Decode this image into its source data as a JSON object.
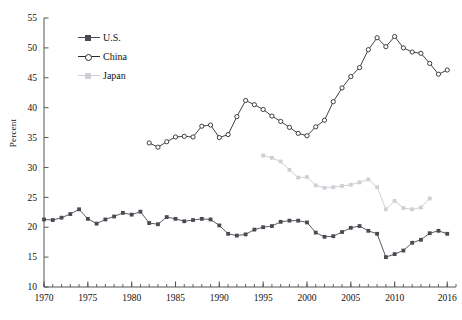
{
  "axes": {
    "ylabel": "Percent",
    "ylim": [
      10,
      55
    ],
    "yticks": [
      10,
      15,
      20,
      25,
      30,
      35,
      40,
      45,
      50,
      55
    ],
    "xlim": [
      1970,
      2017
    ],
    "xticks": [
      1970,
      1975,
      1980,
      1985,
      1990,
      1995,
      2000,
      2005,
      2010,
      2016
    ],
    "xtick_labels": [
      "1970",
      "1975",
      "1980",
      "1985",
      "1990",
      "1995",
      "2000",
      "2005",
      "2010",
      "2016"
    ],
    "minor_tick_step": 1
  },
  "legend": {
    "position": "top-left-inside",
    "entries": [
      {
        "label": "U.S.",
        "marker": "filled-square",
        "color": "#4a4a52"
      },
      {
        "label": "China",
        "marker": "open-circle",
        "color": "#2b2b2b"
      },
      {
        "label": "Japan",
        "marker": "filled-square",
        "color": "#cfcfd6"
      }
    ]
  },
  "caption": "",
  "chart_data": {
    "type": "line",
    "title": "",
    "xlabel": "",
    "ylabel": "Percent",
    "xlim": [
      1970,
      2017
    ],
    "ylim": [
      10,
      55
    ],
    "grid": false,
    "legend_position": "top-left-inside",
    "series": [
      {
        "name": "U.S.",
        "color": "#4a4a52",
        "marker": "filled-square",
        "x": [
          1970,
          1971,
          1972,
          1973,
          1974,
          1975,
          1976,
          1977,
          1978,
          1979,
          1980,
          1981,
          1982,
          1983,
          1984,
          1985,
          1986,
          1987,
          1988,
          1989,
          1990,
          1991,
          1992,
          1993,
          1994,
          1995,
          1996,
          1997,
          1998,
          1999,
          2000,
          2001,
          2002,
          2003,
          2004,
          2005,
          2006,
          2007,
          2008,
          2009,
          2010,
          2011,
          2012,
          2013,
          2014,
          2015,
          2016
        ],
        "y": [
          21.3,
          21.2,
          21.6,
          22.2,
          23.0,
          21.4,
          20.6,
          21.3,
          21.8,
          22.4,
          22.1,
          22.6,
          20.7,
          20.5,
          21.7,
          21.4,
          21.0,
          21.2,
          21.4,
          21.3,
          20.3,
          18.9,
          18.6,
          18.8,
          19.6,
          20.0,
          20.2,
          20.9,
          21.1,
          21.1,
          20.8,
          19.1,
          18.4,
          18.5,
          19.2,
          19.9,
          20.2,
          19.4,
          18.9,
          15.0,
          15.5,
          16.1,
          17.4,
          17.9,
          19.0,
          19.4,
          18.9
        ]
      },
      {
        "name": "China",
        "color": "#2b2b2b",
        "marker": "open-circle",
        "x": [
          1982,
          1983,
          1984,
          1985,
          1986,
          1987,
          1988,
          1989,
          1990,
          1991,
          1992,
          1993,
          1994,
          1995,
          1996,
          1997,
          1998,
          1999,
          2000,
          2001,
          2002,
          2003,
          2004,
          2005,
          2006,
          2007,
          2008,
          2009,
          2010,
          2011,
          2012,
          2013,
          2014,
          2015,
          2016
        ],
        "y": [
          34.1,
          33.4,
          34.3,
          35.1,
          35.2,
          35.1,
          36.9,
          37.1,
          35.0,
          35.5,
          38.5,
          41.2,
          40.5,
          39.7,
          38.6,
          37.7,
          36.7,
          35.7,
          35.3,
          36.8,
          37.9,
          41.0,
          43.3,
          45.2,
          46.7,
          49.7,
          51.7,
          50.2,
          51.9,
          50.0,
          49.3,
          49.1,
          47.4,
          45.6,
          46.3
        ]
      },
      {
        "name": "Japan",
        "color": "#cfcfd6",
        "marker": "filled-square",
        "x": [
          1995,
          1996,
          1997,
          1998,
          1999,
          2000,
          2001,
          2002,
          2003,
          2004,
          2005,
          2006,
          2007,
          2008,
          2009,
          2010,
          2011,
          2012,
          2013,
          2014
        ],
        "y": [
          32.0,
          31.6,
          31.0,
          29.6,
          28.3,
          28.4,
          27.0,
          26.6,
          26.7,
          26.9,
          27.1,
          27.5,
          28.0,
          26.7,
          23.0,
          24.4,
          23.2,
          23.0,
          23.3,
          24.8
        ]
      }
    ]
  }
}
